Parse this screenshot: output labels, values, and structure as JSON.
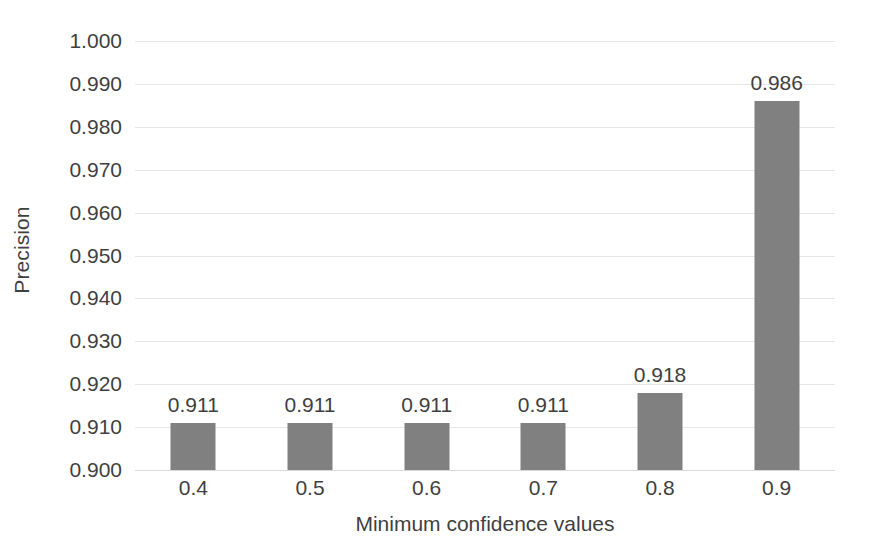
{
  "chart_data": {
    "type": "bar",
    "title": "",
    "categories": [
      "0.4",
      "0.5",
      "0.6",
      "0.7",
      "0.8",
      "0.9"
    ],
    "values": [
      0.911,
      0.911,
      0.911,
      0.911,
      0.918,
      0.986
    ],
    "data_labels": [
      "0.911",
      "0.911",
      "0.911",
      "0.911",
      "0.918",
      "0.986"
    ],
    "xlabel": "Minimum confidence values",
    "ylabel": "Precision",
    "ylim": [
      0.9,
      1.0
    ],
    "ytick_step": 0.01,
    "ytick_labels": [
      "1.000",
      "0.990",
      "0.980",
      "0.970",
      "0.960",
      "0.950",
      "0.940",
      "0.930",
      "0.920",
      "0.910",
      "0.900"
    ],
    "ytick_values": [
      1.0,
      0.99,
      0.98,
      0.97,
      0.96,
      0.95,
      0.94,
      0.93,
      0.92,
      0.91,
      0.9
    ],
    "grid": true,
    "grid_axis": "y",
    "legend": false,
    "legend_position": "none",
    "series": [
      {
        "name": "Precision",
        "values": [
          0.911,
          0.911,
          0.911,
          0.911,
          0.918,
          0.986
        ]
      }
    ],
    "colors": {
      "bar": "#808080",
      "gridline": "#e6e6e6",
      "axis_line": "#d9d9d9",
      "text": "#3f3f3f",
      "background": "#ffffff"
    }
  }
}
